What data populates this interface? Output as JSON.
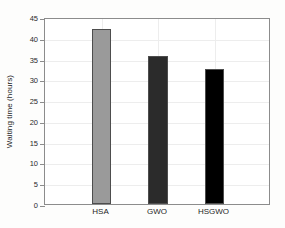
{
  "chart_data": {
    "type": "bar",
    "title": "",
    "subtitle": "",
    "xlabel": "",
    "ylabel": "Waiting time (hours)",
    "categories": [
      "HSA",
      "GWO",
      "HSGWO"
    ],
    "values": [
      42,
      35.5,
      32.5
    ],
    "series": [
      {
        "name": "Waiting time",
        "values": [
          42,
          35.5,
          32.5
        ]
      }
    ],
    "bar_colors": [
      "#9a9a9a",
      "#2b2b2b",
      "#000000"
    ],
    "bar_edge_color": "#4d4d4d",
    "ylim": [
      0,
      45
    ],
    "xlim": [
      0,
      4
    ],
    "yticks": [
      0,
      5,
      10,
      15,
      20,
      25,
      30,
      35,
      40,
      45
    ],
    "ytick_labels": [
      "0",
      "5",
      "10",
      "15",
      "20",
      "25",
      "30",
      "35",
      "40",
      "45"
    ],
    "xticks": [
      1,
      2,
      3
    ],
    "xtick_labels": [
      "HSA",
      "GWO",
      "HSGWO"
    ],
    "grid": true,
    "grid_color": "#ededed",
    "legend": null,
    "legend_position": "none",
    "annotations": [],
    "axes_color": "#8c8c8c",
    "background_color": "#ffffff",
    "figure_background_color": "#fdfdfc"
  }
}
